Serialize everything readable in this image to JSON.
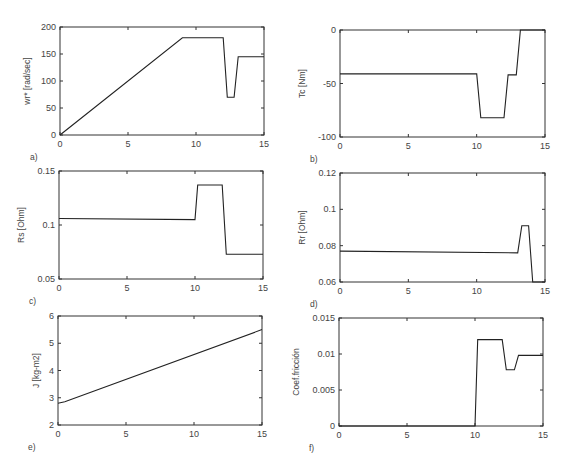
{
  "chart_data": [
    {
      "id": "a",
      "type": "line",
      "panel_label": "a)",
      "title": "",
      "xlabel": "",
      "ylabel": "wr* [rad/sec]",
      "xlim": [
        0,
        15
      ],
      "ylim": [
        0,
        200
      ],
      "xticks": [
        0,
        5,
        10,
        15
      ],
      "yticks": [
        0,
        50,
        100,
        150,
        200
      ],
      "ytick_labels": [
        "0",
        "50",
        "100",
        "150",
        "200"
      ],
      "grid": false,
      "box": {
        "x": 60,
        "y": 27,
        "w": 204,
        "h": 108
      },
      "x": [
        0,
        9,
        12,
        12.3,
        12.8,
        13.1,
        15
      ],
      "y": [
        0,
        180,
        180,
        70,
        70,
        145,
        145
      ]
    },
    {
      "id": "b",
      "type": "line",
      "panel_label": "b)",
      "title": "",
      "xlabel": "",
      "ylabel": "Tc [Nm]",
      "xlim": [
        0,
        15
      ],
      "ylim": [
        -100,
        0
      ],
      "xticks": [
        0,
        5,
        10,
        15
      ],
      "yticks": [
        -100,
        -50,
        0
      ],
      "ytick_labels": [
        "-100",
        "-50",
        "0"
      ],
      "grid": false,
      "box": {
        "x": 340,
        "y": 30,
        "w": 205,
        "h": 107
      },
      "x": [
        0,
        10,
        10.3,
        12,
        12.3,
        12.9,
        13.2,
        15
      ],
      "y": [
        -41,
        -41,
        -82,
        -82,
        -42,
        -42,
        0,
        0
      ]
    },
    {
      "id": "c",
      "type": "line",
      "panel_label": "c)",
      "title": "",
      "xlabel": "",
      "ylabel": "Rs [Ohm]",
      "xlim": [
        0,
        15
      ],
      "ylim": [
        0.05,
        0.15
      ],
      "xticks": [
        0,
        5,
        10,
        15
      ],
      "yticks": [
        0.05,
        0.1,
        0.15
      ],
      "ytick_labels": [
        "0.05",
        "0.1",
        "0.15"
      ],
      "grid": false,
      "box": {
        "x": 59,
        "y": 171,
        "w": 204,
        "h": 108
      },
      "x": [
        0,
        10,
        10.2,
        12,
        12.3,
        15
      ],
      "y": [
        0.106,
        0.105,
        0.137,
        0.137,
        0.073,
        0.073
      ]
    },
    {
      "id": "d",
      "type": "line",
      "panel_label": "d)",
      "title": "",
      "xlabel": "",
      "ylabel": "Rr [Ohm]",
      "xlim": [
        0,
        15
      ],
      "ylim": [
        0.06,
        0.12
      ],
      "xticks": [
        0,
        5,
        10,
        15
      ],
      "yticks": [
        0.06,
        0.08,
        0.1,
        0.12
      ],
      "ytick_labels": [
        "0.06",
        "0.08",
        "0.1",
        "0.12"
      ],
      "grid": false,
      "box": {
        "x": 340,
        "y": 173,
        "w": 205,
        "h": 109
      },
      "x": [
        0,
        13,
        13.3,
        13.8,
        14.1,
        15
      ],
      "y": [
        0.077,
        0.076,
        0.091,
        0.091,
        0.06,
        0.06
      ]
    },
    {
      "id": "e",
      "type": "line",
      "panel_label": "e)",
      "title": "",
      "xlabel": "",
      "ylabel": "J [kg-m2]",
      "xlim": [
        0,
        15
      ],
      "ylim": [
        2,
        6
      ],
      "xticks": [
        0,
        5,
        10,
        15
      ],
      "yticks": [
        2,
        3,
        4,
        5,
        6
      ],
      "ytick_labels": [
        "2",
        "3",
        "4",
        "5",
        "6"
      ],
      "grid": false,
      "box": {
        "x": 58,
        "y": 316,
        "w": 204,
        "h": 109
      },
      "x": [
        0,
        0.5,
        15
      ],
      "y": [
        2.8,
        2.85,
        5.5
      ]
    },
    {
      "id": "f",
      "type": "line",
      "panel_label": "f)",
      "title": "",
      "xlabel": "",
      "ylabel": "Coef.fricción",
      "xlim": [
        0,
        15
      ],
      "ylim": [
        0,
        0.015
      ],
      "xticks": [
        0,
        5,
        10,
        15
      ],
      "yticks": [
        0,
        0.005,
        0.01,
        0.015
      ],
      "ytick_labels": [
        "0",
        "0.005",
        "0.01",
        "0.015"
      ],
      "grid": false,
      "box": {
        "x": 339,
        "y": 318,
        "w": 204,
        "h": 108
      },
      "x": [
        0,
        10,
        10.2,
        12,
        12.3,
        12.9,
        13.2,
        15
      ],
      "y": [
        0,
        0,
        0.012,
        0.012,
        0.0078,
        0.0078,
        0.0098,
        0.0098
      ]
    }
  ]
}
